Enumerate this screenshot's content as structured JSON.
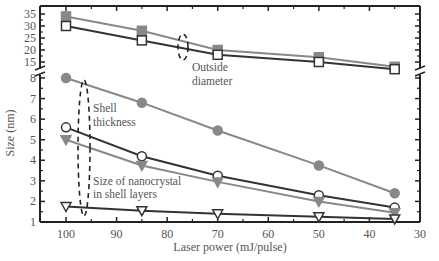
{
  "chart_data": {
    "type": "line",
    "title": "",
    "xlabel": "Laser power (mJ/pulse)",
    "ylabel": "Size (nm)",
    "x": [
      100,
      85,
      70,
      50,
      35
    ],
    "xlim": [
      100,
      30
    ],
    "xticks": [
      "100",
      "90",
      "80",
      "70",
      "60",
      "50",
      "40",
      "30"
    ],
    "y_axis_broken": true,
    "yticks_upper": [
      "35",
      "30",
      "25",
      "20",
      "15"
    ],
    "yticks_lower": [
      "8",
      "7",
      "6",
      "5",
      "4",
      "3",
      "2",
      "1"
    ],
    "series": [
      {
        "name": "Outside diameter (filled square)",
        "marker": "filled-square",
        "values": [
          34,
          28,
          20,
          17,
          13
        ]
      },
      {
        "name": "Outside diameter (open square)",
        "marker": "open-square",
        "values": [
          30,
          24,
          18,
          15,
          12
        ]
      },
      {
        "name": "Shell thickness (filled circle)",
        "marker": "filled-circle",
        "values": [
          8.0,
          6.8,
          5.45,
          3.75,
          2.4
        ]
      },
      {
        "name": "Shell thickness (open circle)",
        "marker": "open-circle",
        "values": [
          5.6,
          4.2,
          3.25,
          2.3,
          1.7
        ]
      },
      {
        "name": "Size of nanocrystal in shell layers (filled triangle)",
        "marker": "filled-triangle",
        "values": [
          5.0,
          3.75,
          2.95,
          2.0,
          1.45
        ]
      },
      {
        "name": "Size of nanocrystal in shell layers (open triangle)",
        "marker": "open-triangle",
        "values": [
          1.75,
          1.55,
          1.4,
          1.25,
          1.15
        ]
      }
    ],
    "annotations": [
      "Outside diameter",
      "Shell thickness",
      "Size of nanocrystal in shell layers"
    ],
    "grid": false,
    "legend": "none"
  },
  "labels": {
    "xlabel": "Laser power (mJ/pulse)",
    "ylabel": "Size (nm)",
    "ann_outside_1": "Outside",
    "ann_outside_2": "diameter",
    "ann_shell_1": "Shell",
    "ann_shell_2": "thickness",
    "ann_nano_1": "Size of nanocrystal",
    "ann_nano_2": "in shell layers"
  }
}
